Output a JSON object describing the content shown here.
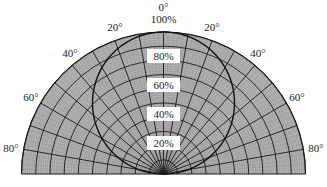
{
  "chart_data": {
    "type": "polar",
    "title": "",
    "subtitle": "",
    "angular_axis": {
      "range_deg": [
        -90,
        90
      ],
      "tick_labels": [
        "80°",
        "60°",
        "40°",
        "20°",
        "0°",
        "20°",
        "40°",
        "60°",
        "80°"
      ],
      "tick_values_deg": [
        -80,
        -60,
        -40,
        -20,
        0,
        20,
        40,
        60,
        80
      ],
      "major_line_step_deg": 10
    },
    "radial_axis": {
      "range": [
        0,
        100
      ],
      "unit": "%",
      "tick_labels": [
        "20%",
        "40%",
        "60%",
        "80%",
        "100%"
      ],
      "tick_values": [
        20,
        40,
        60,
        80,
        100
      ],
      "ring_step": 10
    },
    "grid": true,
    "legend": null,
    "series": [
      {
        "name": "intensity distribution (cosine lobe)",
        "theta_deg": [
          -90,
          -80,
          -60,
          -40,
          -20,
          0,
          20,
          40,
          60,
          80,
          90
        ],
        "r_percent": [
          0,
          17,
          50,
          77,
          94,
          100,
          94,
          77,
          50,
          17,
          0
        ]
      }
    ]
  },
  "labels": {
    "top_angle": "0°",
    "top_percent": "100%",
    "left_angles": [
      "20°",
      "40°",
      "60°",
      "80°"
    ],
    "right_angles": [
      "20°",
      "40°",
      "60°",
      "80°"
    ],
    "percents": [
      "80%",
      "60%",
      "40%",
      "20%"
    ]
  },
  "colors": {
    "fill": "#b4b4b4",
    "hatch": "#8a8a8a",
    "grid": "#1a1a1a",
    "curve": "#111111",
    "label_box": "#ffffff"
  }
}
